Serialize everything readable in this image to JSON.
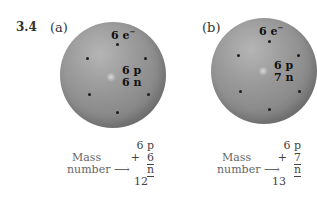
{
  "figure": {
    "number": "3.4",
    "panels": [
      {
        "label": "(a)",
        "electron_label": "6 e",
        "electron_sup": "−",
        "protons": "6 p",
        "neutrons": "6 n",
        "sum_protons": "6 p",
        "sum_plus": "+",
        "sum_neutrons": "6 n",
        "mass_label_1": "Mass",
        "mass_label_2": "number",
        "arrow": "⟶",
        "mass_number": "12"
      },
      {
        "label": "(b)",
        "electron_label": "6 e",
        "electron_sup": "−",
        "protons": "6 p",
        "neutrons": "7 n",
        "sum_protons": "6 p",
        "sum_plus": "+",
        "sum_neutrons": "7 n",
        "mass_label_1": "Mass",
        "mass_label_2": "number",
        "arrow": "⟶",
        "mass_number": "13"
      }
    ]
  },
  "colors": {
    "sphere": "#9a9a9a",
    "electron": "#1c1c1c",
    "text": "#222222"
  }
}
